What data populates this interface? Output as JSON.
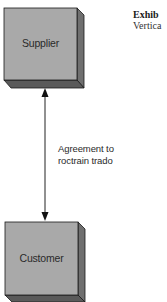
{
  "diagram": {
    "nodes": [
      {
        "id": "supplier",
        "label": "Supplier"
      },
      {
        "id": "customer",
        "label": "Customer"
      }
    ],
    "edges": [
      {
        "from": "supplier",
        "to": "customer",
        "direction": "bidirectional",
        "label_lines": [
          "Agreement to",
          "roctrain trado"
        ]
      }
    ]
  },
  "exhibit": {
    "title": "Exhib",
    "subtitle": "Vertica"
  },
  "colors": {
    "box_front": "#a9a9a9",
    "box_side": "#6f6f6f",
    "box_bottom": "#5a5a5a",
    "outline": "#1a1a1a",
    "arrow": "#222222"
  }
}
